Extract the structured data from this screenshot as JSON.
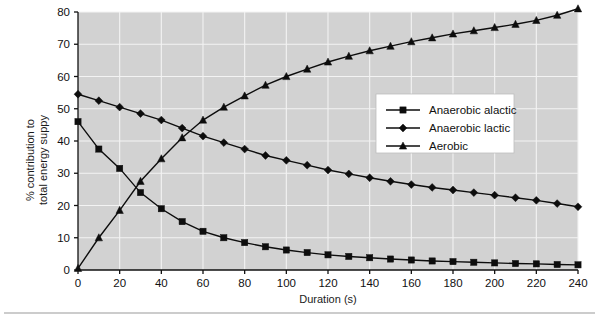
{
  "chart_data": {
    "type": "line",
    "title": "",
    "subtitle": "",
    "xlabel": "Duration (s)",
    "ylabel_line1": "% contribution to",
    "ylabel_line2": "total energy suppy",
    "xlim": [
      0,
      240
    ],
    "ylim": [
      0,
      80
    ],
    "xticks": [
      0,
      20,
      40,
      60,
      80,
      100,
      120,
      140,
      160,
      180,
      200,
      220,
      240
    ],
    "yticks": [
      0,
      10,
      20,
      30,
      40,
      50,
      60,
      70,
      80
    ],
    "xtick_labels": [
      "0",
      "20",
      "40",
      "60",
      "80",
      "100",
      "120",
      "140",
      "160",
      "180",
      "200",
      "220",
      "240"
    ],
    "ytick_labels": [
      "0",
      "10",
      "20",
      "30",
      "40",
      "50",
      "60",
      "70",
      "80"
    ],
    "grid": true,
    "grid_color": "#f3f3f3",
    "plot_background": "#d2d2d2",
    "legend_position": "upper right",
    "x": [
      0,
      10,
      20,
      30,
      40,
      50,
      60,
      70,
      80,
      90,
      100,
      110,
      120,
      130,
      140,
      150,
      160,
      170,
      180,
      190,
      200,
      210,
      220,
      230,
      240
    ],
    "series": [
      {
        "name": "Anaerobic alactic",
        "marker": "square",
        "color": "#0d0d0d",
        "values": [
          46.0,
          37.5,
          31.5,
          24.0,
          19.0,
          15.0,
          12.0,
          10.0,
          8.5,
          7.2,
          6.2,
          5.4,
          4.7,
          4.2,
          3.8,
          3.4,
          3.1,
          2.8,
          2.6,
          2.4,
          2.2,
          2.0,
          1.9,
          1.7,
          1.6
        ]
      },
      {
        "name": "Anaerobic lactic",
        "marker": "diamond",
        "color": "#0d0d0d",
        "values": [
          54.5,
          52.5,
          50.5,
          48.5,
          46.5,
          44.0,
          41.5,
          39.5,
          37.5,
          35.5,
          34.0,
          32.5,
          31.0,
          29.8,
          28.6,
          27.5,
          26.5,
          25.6,
          24.8,
          24.0,
          23.2,
          22.4,
          21.6,
          20.6,
          19.6
        ]
      },
      {
        "name": "Aerobic",
        "marker": "triangle",
        "color": "#0d0d0d",
        "values": [
          0.5,
          10.0,
          18.5,
          27.5,
          34.5,
          41.0,
          46.5,
          50.5,
          54.0,
          57.3,
          60.0,
          62.3,
          64.5,
          66.3,
          68.0,
          69.4,
          70.8,
          72.0,
          73.2,
          74.2,
          75.2,
          76.2,
          77.4,
          79.0,
          81.0
        ]
      }
    ]
  },
  "legend": {
    "entries": [
      {
        "label": "Anaerobic alactic",
        "marker": "square"
      },
      {
        "label": "Anaerobic lactic",
        "marker": "diamond"
      },
      {
        "label": "Aerobic",
        "marker": "triangle"
      }
    ]
  }
}
